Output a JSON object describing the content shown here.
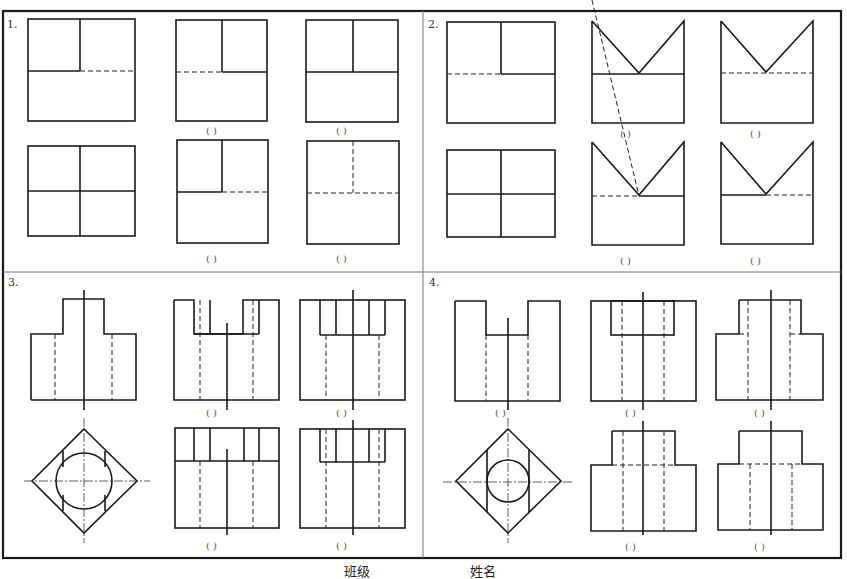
{
  "header": {
    "cut_text": "…题…补画视图中所缺的图线…"
  },
  "problems": [
    {
      "number": "1.",
      "answer_slots": [
        "(   )",
        "(   )",
        "(   )",
        "(   )"
      ]
    },
    {
      "number": "2.",
      "answer_slots": [
        "(   )",
        "(   )",
        "(   )",
        "(   )"
      ]
    },
    {
      "number": "3.",
      "answer_slots": [
        "(   )",
        "(   )",
        "(   )",
        "(   )"
      ]
    },
    {
      "number": "4.",
      "answer_slots": [
        "(   )",
        "(   )",
        "(   )",
        "(   )",
        "(   )"
      ]
    }
  ],
  "footer": {
    "class_label": "班级",
    "name_label": "姓名"
  }
}
